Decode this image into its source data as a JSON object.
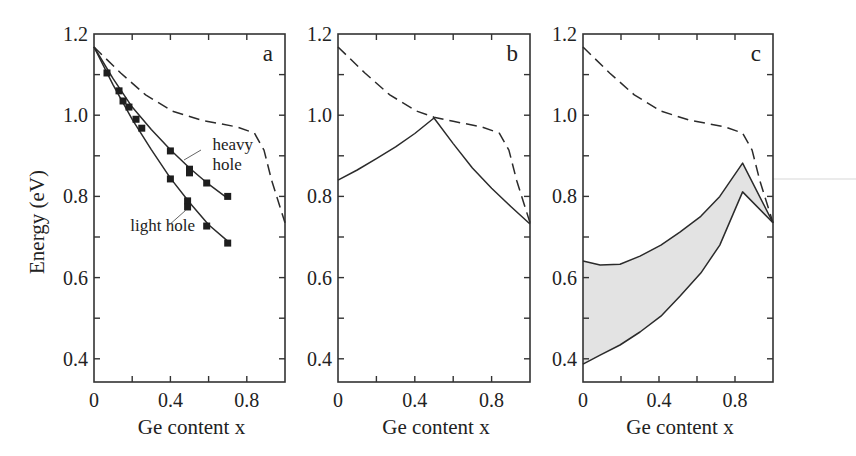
{
  "figure": {
    "ylabel": "Energy (eV)",
    "xlabel": "Ge content x"
  },
  "colors": {
    "line": "#2b2b2b",
    "shade": "#e3e3e3",
    "axis": "#333333",
    "artifact": "#e2e2e2"
  },
  "chart_data": [
    {
      "type": "line",
      "panel": "a",
      "title": "a",
      "xlabel": "Ge content x",
      "ylabel": "Energy (eV)",
      "xlim": [
        0,
        1.0
      ],
      "ylim": [
        0.345,
        1.2
      ],
      "xticks": [
        0,
        0.4,
        0.8
      ],
      "xticks_minor": [
        0.2,
        0.6
      ],
      "yticks": [
        0.4,
        0.6,
        0.8,
        1.0,
        1.2
      ],
      "yticks_minor": [
        0.5,
        0.7,
        0.9,
        1.1
      ],
      "grid": false,
      "series": [
        {
          "name": "band gap (dashed)",
          "style": "dashed",
          "x": [
            0,
            0.14,
            0.27,
            0.41,
            0.56,
            0.75,
            0.84,
            0.89,
            0.93,
            1.0
          ],
          "y": [
            1.168,
            1.104,
            1.05,
            1.01,
            0.988,
            0.971,
            0.956,
            0.914,
            0.84,
            0.735
          ]
        },
        {
          "name": "heavy hole (fit)",
          "style": "solid",
          "x": [
            0,
            0.1,
            0.2,
            0.3,
            0.4,
            0.5,
            0.6,
            0.7
          ],
          "y": [
            1.168,
            1.09,
            1.02,
            0.965,
            0.915,
            0.87,
            0.83,
            0.795
          ]
        },
        {
          "name": "light hole (fit)",
          "style": "solid",
          "x": [
            0,
            0.1,
            0.2,
            0.3,
            0.4,
            0.5,
            0.6,
            0.7
          ],
          "y": [
            1.168,
            1.075,
            0.99,
            0.915,
            0.845,
            0.785,
            0.73,
            0.69
          ]
        },
        {
          "name": "experimental points",
          "style": "markers",
          "x": [
            0.068,
            0.131,
            0.152,
            0.183,
            0.22,
            0.25,
            0.4,
            0.5,
            0.5,
            0.59,
            0.7,
            0.4,
            0.49,
            0.49,
            0.59,
            0.7
          ],
          "y": [
            1.104,
            1.06,
            1.035,
            1.02,
            0.99,
            0.968,
            0.912,
            0.867,
            0.858,
            0.833,
            0.8,
            0.843,
            0.789,
            0.774,
            0.727,
            0.685
          ]
        }
      ],
      "annotations": [
        {
          "text": "heavy",
          "x": 0.62,
          "y": 0.915
        },
        {
          "text": "hole",
          "x": 0.62,
          "y": 0.865
        },
        {
          "text": "light hole",
          "x": 0.19,
          "y": 0.715
        }
      ]
    },
    {
      "type": "line",
      "panel": "b",
      "title": "b",
      "xlabel": "Ge content x",
      "xlim": [
        0,
        1.0
      ],
      "ylim": [
        0.345,
        1.2
      ],
      "xticks": [
        0,
        0.4,
        0.8
      ],
      "yticks": [
        0.4,
        0.6,
        0.8,
        1.0,
        1.2
      ],
      "grid": false,
      "series": [
        {
          "name": "band gap (dashed)",
          "style": "dashed",
          "x": [
            0,
            0.14,
            0.27,
            0.41,
            0.5,
            0.6,
            0.75,
            0.84,
            0.89,
            0.93,
            1.0
          ],
          "y": [
            1.168,
            1.104,
            1.05,
            1.01,
            0.995,
            0.985,
            0.971,
            0.956,
            0.914,
            0.84,
            0.735
          ]
        },
        {
          "name": "strained gap (solid)",
          "style": "solid",
          "x": [
            0,
            0.1,
            0.2,
            0.3,
            0.4,
            0.5,
            0.6,
            0.7,
            0.8,
            0.9,
            1.0
          ],
          "y": [
            0.84,
            0.865,
            0.893,
            0.922,
            0.955,
            0.993,
            0.93,
            0.87,
            0.82,
            0.775,
            0.732
          ]
        }
      ]
    },
    {
      "type": "area",
      "panel": "c",
      "title": "c",
      "xlabel": "Ge content x",
      "xlim": [
        0,
        1.0
      ],
      "ylim": [
        0.345,
        1.2
      ],
      "xticks": [
        0,
        0.4,
        0.8
      ],
      "yticks": [
        0.4,
        0.6,
        0.8,
        1.0,
        1.2
      ],
      "grid": false,
      "series": [
        {
          "name": "band gap (dashed)",
          "style": "dashed",
          "x": [
            0,
            0.14,
            0.27,
            0.41,
            0.56,
            0.75,
            0.84,
            0.89,
            0.93,
            1.0
          ],
          "y": [
            1.168,
            1.104,
            1.05,
            1.01,
            0.988,
            0.971,
            0.956,
            0.914,
            0.84,
            0.735
          ]
        },
        {
          "name": "upper bound (solid)",
          "style": "solid",
          "x": [
            0,
            0.09,
            0.195,
            0.3,
            0.41,
            0.51,
            0.62,
            0.72,
            0.84,
            1.0
          ],
          "y": [
            0.641,
            0.631,
            0.633,
            0.653,
            0.68,
            0.712,
            0.751,
            0.8,
            0.882,
            0.735
          ]
        },
        {
          "name": "lower bound (solid)",
          "style": "solid",
          "x": [
            0,
            0.09,
            0.195,
            0.3,
            0.41,
            0.51,
            0.62,
            0.72,
            0.84,
            1.0
          ],
          "y": [
            0.387,
            0.409,
            0.434,
            0.466,
            0.505,
            0.554,
            0.611,
            0.68,
            0.811,
            0.735
          ]
        }
      ],
      "fill_between": [
        "upper bound (solid)",
        "lower bound (solid)"
      ]
    }
  ],
  "panels": [
    {
      "letter": "a",
      "left": 94,
      "right": 285,
      "xlabel": "Ge content x",
      "ticklabels": {
        "x": [
          "0",
          "0.4",
          "0.8"
        ],
        "y": [
          "0.4",
          "0.6",
          "0.8",
          "1.0",
          "1.2"
        ]
      }
    },
    {
      "letter": "b",
      "left": 338,
      "right": 530,
      "xlabel": "Ge content x",
      "ticklabels": {
        "x": [
          "0",
          "0.4",
          "0.8"
        ],
        "y": [
          "0.4",
          "0.6",
          "0.8",
          "1.0",
          "1.2"
        ]
      }
    },
    {
      "letter": "c",
      "left": 583,
      "right": 773,
      "xlabel": "Ge content x",
      "ticklabels": {
        "x": [
          "0",
          "0.4",
          "0.8"
        ],
        "y": [
          "0.4",
          "0.6",
          "0.8",
          "1.0",
          "1.2"
        ]
      }
    }
  ]
}
